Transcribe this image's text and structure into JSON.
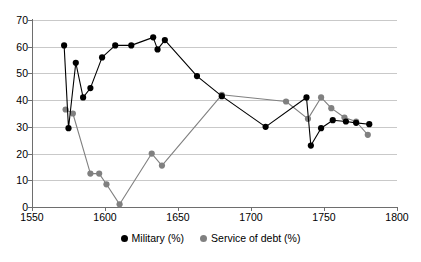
{
  "chart_data": {
    "type": "line",
    "title": "",
    "subtitle": "",
    "xlabel": "",
    "ylabel": "",
    "xlim": [
      1550,
      1800
    ],
    "ylim": [
      0,
      70
    ],
    "xticks": [
      1550,
      1600,
      1650,
      1700,
      1750,
      1800
    ],
    "xtick_labels": [
      "1550",
      "1600",
      "1650",
      "1700",
      "1750",
      "1800"
    ],
    "yticks": [
      0,
      10,
      20,
      30,
      40,
      50,
      60,
      70
    ],
    "ytick_labels": [
      "0",
      "10",
      "20",
      "30",
      "40",
      "50",
      "60",
      "70"
    ],
    "grid": "horizontal",
    "legend_position": "bottom-center",
    "markers": "filled-circle",
    "series": [
      {
        "name": "Military (%)",
        "color": "#000000",
        "points": [
          [
            1572,
            60.5
          ],
          [
            1575,
            29.5
          ],
          [
            1580,
            54.0
          ],
          [
            1585,
            41.0
          ],
          [
            1590,
            44.5
          ],
          [
            1598,
            56.0
          ],
          [
            1607,
            60.5
          ],
          [
            1618,
            60.5
          ],
          [
            1633,
            63.5
          ],
          [
            1636,
            59.0
          ],
          [
            1641,
            62.5
          ],
          [
            1663,
            49.0
          ],
          [
            1680,
            41.5
          ],
          [
            1710,
            30.0
          ],
          [
            1738,
            41.0
          ],
          [
            1741,
            23.0
          ],
          [
            1748,
            29.5
          ],
          [
            1756,
            32.5
          ],
          [
            1765,
            32.0
          ],
          [
            1772,
            31.5
          ],
          [
            1781,
            31.0
          ]
        ]
      },
      {
        "name": "Service of debt (%)",
        "color": "#808080",
        "points": [
          [
            1573,
            36.5
          ],
          [
            1578,
            35.0
          ],
          [
            1590,
            12.5
          ],
          [
            1596,
            12.5
          ],
          [
            1601,
            8.5
          ],
          [
            1610,
            1.0
          ],
          [
            1632,
            20.0
          ],
          [
            1639,
            15.5
          ],
          [
            1680,
            42.0
          ],
          [
            1724,
            39.5
          ],
          [
            1739,
            33.0
          ],
          [
            1748,
            41.0
          ],
          [
            1755,
            37.0
          ],
          [
            1764,
            33.5
          ],
          [
            1772,
            32.0
          ],
          [
            1780,
            27.0
          ]
        ]
      }
    ]
  },
  "legend": {
    "items": [
      {
        "label": "Military (%)",
        "color": "#000000"
      },
      {
        "label": "Service of debt (%)",
        "color": "#808080"
      }
    ]
  },
  "colors": {
    "military": "#000000",
    "service_of_debt": "#808080",
    "gridline": "#c9c9c9",
    "axis": "#6e6e6e",
    "background": "#ffffff"
  }
}
